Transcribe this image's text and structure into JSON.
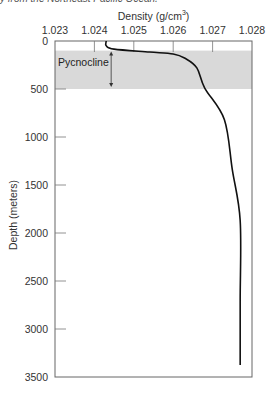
{
  "caption": "y from the Northeast Pacific Ocean.",
  "chart_data": {
    "type": "line",
    "title_main": "Density (g/cm",
    "title_sup": "3",
    "title_tail": ")",
    "xlabel": "Density (g/cm³)",
    "ylabel": "Depth (meters)",
    "x_axis_position": "top",
    "y_axis_inverted": true,
    "xlim": [
      1.023,
      1.028
    ],
    "ylim": [
      0,
      3500
    ],
    "xticks": [
      "1.023",
      "1.024",
      "1.025",
      "1.026",
      "1.027",
      "1.028"
    ],
    "yticks": [
      "0",
      "500",
      "1000",
      "1500",
      "2000",
      "2500",
      "3000",
      "3500"
    ],
    "grid": false,
    "series": [
      {
        "name": "Density profile",
        "color": "#111111",
        "points": [
          {
            "density": 1.0243,
            "depth": 0
          },
          {
            "density": 1.0243,
            "depth": 50
          },
          {
            "density": 1.0245,
            "depth": 85
          },
          {
            "density": 1.0254,
            "depth": 115
          },
          {
            "density": 1.026,
            "depth": 135
          },
          {
            "density": 1.0263,
            "depth": 180
          },
          {
            "density": 1.0266,
            "depth": 280
          },
          {
            "density": 1.0268,
            "depth": 490
          },
          {
            "density": 1.0273,
            "depth": 820
          },
          {
            "density": 1.0275,
            "depth": 1340
          },
          {
            "density": 1.0277,
            "depth": 1870
          },
          {
            "density": 1.0277,
            "depth": 2700
          },
          {
            "density": 1.0277,
            "depth": 3375
          }
        ]
      }
    ],
    "annotations": [
      {
        "type": "shaded_band",
        "label": "Pycnocline",
        "depth_range": [
          100,
          500
        ],
        "color": "#d9d9d9"
      },
      {
        "type": "double_arrow",
        "depth_range": [
          100,
          480
        ],
        "density": 1.0244
      }
    ]
  }
}
